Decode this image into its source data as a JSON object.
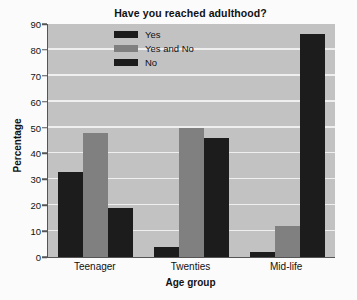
{
  "chart_data": {
    "type": "bar",
    "title": "Have you reached adulthood?",
    "xlabel": "Age group",
    "ylabel": "Percentage",
    "categories": [
      "Teenager",
      "Twenties",
      "Mid-life"
    ],
    "series": [
      {
        "name": "Yes",
        "values": [
          33,
          4,
          2
        ],
        "color": "#1c1c1c"
      },
      {
        "name": "Yes and No",
        "values": [
          48,
          50,
          12
        ],
        "color": "#808080"
      },
      {
        "name": "No",
        "values": [
          19,
          46,
          86
        ],
        "color": "#1c1c1c"
      }
    ],
    "ylim": [
      0,
      90
    ],
    "yticks": [
      0,
      10,
      20,
      30,
      40,
      50,
      60,
      70,
      80,
      90
    ],
    "grid": true,
    "legend_position": "upper-left-inside",
    "plot_background": "#c2c2c2",
    "gridline_color": "#efefef",
    "axis_color": "#555555"
  },
  "artifacts": {
    "ghost_line_1": "REMOTE",
    "ghost_line_2": "adulthood"
  }
}
